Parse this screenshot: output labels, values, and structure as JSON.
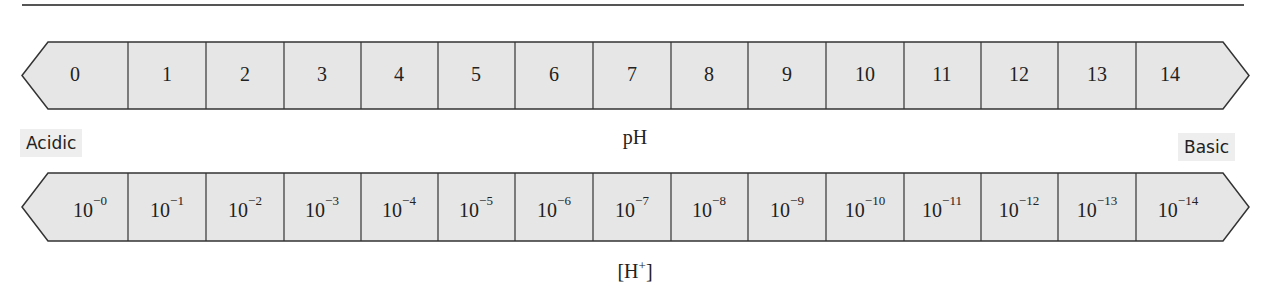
{
  "diagram": {
    "ph_row": {
      "axis_label": "pH",
      "values": [
        "0",
        "1",
        "2",
        "3",
        "4",
        "5",
        "6",
        "7",
        "8",
        "9",
        "10",
        "11",
        "12",
        "13",
        "14"
      ]
    },
    "h_row": {
      "axis_label": "[H+]",
      "base": "10",
      "exponents": [
        "−0",
        "−1",
        "−2",
        "−3",
        "−4",
        "−5",
        "−6",
        "−7",
        "−8",
        "−9",
        "−10",
        "−11",
        "−12",
        "−13",
        "−14"
      ]
    },
    "left_label": "Acidic",
    "right_label": "Basic",
    "colors": {
      "cell_fill": "#e6e6e6",
      "stroke": "#333333",
      "label_bg": "#eeeeee"
    }
  }
}
